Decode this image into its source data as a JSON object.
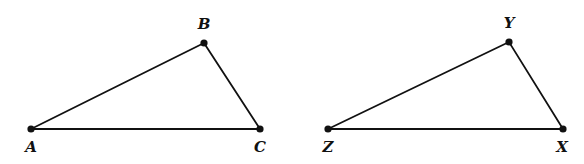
{
  "diagram": {
    "type": "geometry",
    "colors": {
      "stroke": "#111111",
      "background": "#ffffff"
    },
    "triangles": [
      {
        "name": "triangle-ABC",
        "vertices": [
          {
            "id": "A",
            "label": "A",
            "x": 31,
            "y": 129,
            "label_x": 31,
            "label_y": 152
          },
          {
            "id": "B",
            "label": "B",
            "x": 204,
            "y": 43,
            "label_x": 204,
            "label_y": 29
          },
          {
            "id": "C",
            "label": "C",
            "x": 260,
            "y": 129,
            "label_x": 260,
            "label_y": 152
          }
        ],
        "edges": [
          [
            "A",
            "B"
          ],
          [
            "B",
            "C"
          ],
          [
            "A",
            "C"
          ]
        ]
      },
      {
        "name": "triangle-ZYX",
        "vertices": [
          {
            "id": "Z",
            "label": "Z",
            "x": 328,
            "y": 129,
            "label_x": 328,
            "label_y": 152
          },
          {
            "id": "Y",
            "label": "Y",
            "x": 509,
            "y": 42,
            "label_x": 509,
            "label_y": 28
          },
          {
            "id": "X",
            "label": "X",
            "x": 563,
            "y": 129,
            "label_x": 562,
            "label_y": 152
          }
        ],
        "edges": [
          [
            "Z",
            "Y"
          ],
          [
            "Y",
            "X"
          ],
          [
            "Z",
            "X"
          ]
        ]
      }
    ]
  }
}
